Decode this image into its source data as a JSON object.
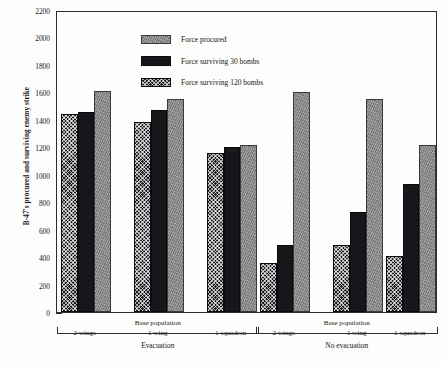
{
  "chart_data": {
    "type": "bar",
    "title": "",
    "xlabel": "Base population",
    "ylabel": "B-47's procured and surviving enemy strike",
    "ylim": [
      0,
      2200
    ],
    "ytick_step": 200,
    "yticks": [
      0,
      200,
      400,
      600,
      800,
      1000,
      1200,
      1400,
      1600,
      1800,
      2000,
      2200
    ],
    "grid": false,
    "legend_position": "top-left-inside",
    "bar_order_in_group": [
      "Force surviving 120 bombs",
      "Force surviving 30 bombs",
      "Force procured"
    ],
    "categories": [
      "2 wings",
      "1 wing",
      "1 squadron",
      "2 wings",
      "1 wing",
      "1 squadron"
    ],
    "sections": [
      {
        "label": "Evacuation",
        "sublabel": "Base population",
        "categories": [
          "2 wings",
          "1 wing",
          "1 squadron"
        ]
      },
      {
        "label": "No evacuation",
        "sublabel": "Base population",
        "categories": [
          "2 wings",
          "1 wing",
          "1 squadron"
        ]
      }
    ],
    "series": [
      {
        "name": "Force procured",
        "key": "procured",
        "color": "#8d8d8d",
        "values": [
          1610,
          1555,
          1215,
          1600,
          1555,
          1215
        ]
      },
      {
        "name": "Force surviving 30 bombs",
        "key": "surv30",
        "color": "#17161a",
        "values": [
          1460,
          1475,
          1200,
          490,
          730,
          930
        ]
      },
      {
        "name": "Force surviving 120 bombs",
        "key": "surv120",
        "color": "#1d1c20",
        "values": [
          1445,
          1385,
          1155,
          355,
          490,
          410
        ]
      }
    ]
  },
  "legend": {
    "items": [
      {
        "label": "Force procured",
        "key": "procured"
      },
      {
        "label": "Force surviving 30 bombs",
        "key": "surv30"
      },
      {
        "label": "Force surviving 120 bombs",
        "key": "surv120"
      }
    ]
  },
  "axis": {
    "y_title": "B-47's procured and surviving enemy strike"
  }
}
